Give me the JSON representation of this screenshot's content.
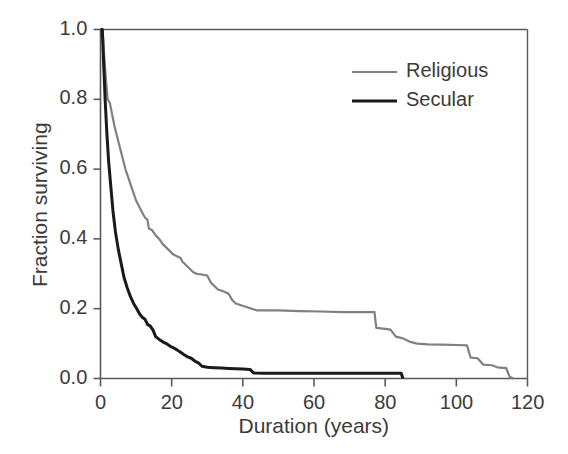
{
  "chart_data": {
    "type": "line",
    "title": "",
    "xlabel": "Duration (years)",
    "ylabel": "Fraction surviving",
    "xlim": [
      0,
      120
    ],
    "ylim": [
      0.0,
      1.0
    ],
    "xticks": [
      0,
      20,
      40,
      60,
      80,
      100,
      120
    ],
    "xtick_labels": [
      "0",
      "20",
      "40",
      "60",
      "80",
      "100",
      "120"
    ],
    "yticks": [
      0.0,
      0.2,
      0.4,
      0.6,
      0.8,
      1.0
    ],
    "ytick_labels": [
      "0.0",
      "0.2",
      "0.4",
      "0.6",
      "0.8",
      "1.0"
    ],
    "grid": false,
    "legend_position": "top-right",
    "series": [
      {
        "name": "Religious",
        "color": "#808080",
        "linewidth": 2.2,
        "points": [
          [
            0,
            1.0
          ],
          [
            0.6,
            1.0
          ],
          [
            1.0,
            0.93
          ],
          [
            1.5,
            0.86
          ],
          [
            2.0,
            0.8
          ],
          [
            2.6,
            0.79
          ],
          [
            3.2,
            0.76
          ],
          [
            4.0,
            0.72
          ],
          [
            5.0,
            0.68
          ],
          [
            6.0,
            0.64
          ],
          [
            7.0,
            0.6
          ],
          [
            8.0,
            0.57
          ],
          [
            9.0,
            0.54
          ],
          [
            10.0,
            0.51
          ],
          [
            11.0,
            0.49
          ],
          [
            12.0,
            0.47
          ],
          [
            12.6,
            0.46
          ],
          [
            13.2,
            0.455
          ],
          [
            13.6,
            0.43
          ],
          [
            14.5,
            0.425
          ],
          [
            15.5,
            0.41
          ],
          [
            16.5,
            0.4
          ],
          [
            17.5,
            0.385
          ],
          [
            18.5,
            0.375
          ],
          [
            19.5,
            0.365
          ],
          [
            20.5,
            0.355
          ],
          [
            21.5,
            0.35
          ],
          [
            22.5,
            0.345
          ],
          [
            23.0,
            0.335
          ],
          [
            24.0,
            0.325
          ],
          [
            25.0,
            0.315
          ],
          [
            26.0,
            0.305
          ],
          [
            27.0,
            0.3
          ],
          [
            28.5,
            0.298
          ],
          [
            30.0,
            0.295
          ],
          [
            31.0,
            0.275
          ],
          [
            32.0,
            0.265
          ],
          [
            33.0,
            0.255
          ],
          [
            34.5,
            0.25
          ],
          [
            36.0,
            0.243
          ],
          [
            37.0,
            0.225
          ],
          [
            38.0,
            0.215
          ],
          [
            39.5,
            0.21
          ],
          [
            41.0,
            0.205
          ],
          [
            42.5,
            0.2
          ],
          [
            44.0,
            0.195
          ],
          [
            50.0,
            0.195
          ],
          [
            56.0,
            0.193
          ],
          [
            62.0,
            0.192
          ],
          [
            68.0,
            0.19
          ],
          [
            74.0,
            0.19
          ],
          [
            77.0,
            0.19
          ],
          [
            77.5,
            0.145
          ],
          [
            80.0,
            0.142
          ],
          [
            81.5,
            0.14
          ],
          [
            83.0,
            0.12
          ],
          [
            85.0,
            0.115
          ],
          [
            87.0,
            0.105
          ],
          [
            89.0,
            0.1
          ],
          [
            92.0,
            0.098
          ],
          [
            96.0,
            0.097
          ],
          [
            100.0,
            0.096
          ],
          [
            103.0,
            0.095
          ],
          [
            104.0,
            0.06
          ],
          [
            106.0,
            0.058
          ],
          [
            107.5,
            0.04
          ],
          [
            110.0,
            0.038
          ],
          [
            111.5,
            0.032
          ],
          [
            114.0,
            0.03
          ],
          [
            115.0,
            0.005
          ],
          [
            116.0,
            0.0
          ]
        ]
      },
      {
        "name": "Secular",
        "color": "#1a1a1a",
        "linewidth": 3.0,
        "points": [
          [
            0,
            1.0
          ],
          [
            0.5,
            1.0
          ],
          [
            0.9,
            0.9
          ],
          [
            1.3,
            0.8
          ],
          [
            1.8,
            0.7
          ],
          [
            2.3,
            0.62
          ],
          [
            2.9,
            0.55
          ],
          [
            3.5,
            0.48
          ],
          [
            4.2,
            0.42
          ],
          [
            5.0,
            0.37
          ],
          [
            5.8,
            0.33
          ],
          [
            6.6,
            0.29
          ],
          [
            7.5,
            0.26
          ],
          [
            8.4,
            0.235
          ],
          [
            9.3,
            0.215
          ],
          [
            10.2,
            0.2
          ],
          [
            11.0,
            0.185
          ],
          [
            11.8,
            0.175
          ],
          [
            12.5,
            0.17
          ],
          [
            13.2,
            0.155
          ],
          [
            14.0,
            0.15
          ],
          [
            14.8,
            0.138
          ],
          [
            15.5,
            0.12
          ],
          [
            16.5,
            0.112
          ],
          [
            17.5,
            0.105
          ],
          [
            18.5,
            0.1
          ],
          [
            19.5,
            0.093
          ],
          [
            20.5,
            0.088
          ],
          [
            21.5,
            0.082
          ],
          [
            22.5,
            0.075
          ],
          [
            23.5,
            0.068
          ],
          [
            24.5,
            0.062
          ],
          [
            25.5,
            0.058
          ],
          [
            26.5,
            0.05
          ],
          [
            27.5,
            0.045
          ],
          [
            28.5,
            0.035
          ],
          [
            30.0,
            0.032
          ],
          [
            32.0,
            0.031
          ],
          [
            34.0,
            0.03
          ],
          [
            36.0,
            0.029
          ],
          [
            38.0,
            0.028
          ],
          [
            40.0,
            0.027
          ],
          [
            42.0,
            0.026
          ],
          [
            43.0,
            0.016
          ],
          [
            46.0,
            0.015
          ],
          [
            52.0,
            0.015
          ],
          [
            58.0,
            0.015
          ],
          [
            64.0,
            0.015
          ],
          [
            70.0,
            0.015
          ],
          [
            76.0,
            0.015
          ],
          [
            82.0,
            0.015
          ],
          [
            84.5,
            0.015
          ],
          [
            85.0,
            0.0
          ]
        ]
      }
    ]
  },
  "legend": {
    "items": [
      {
        "label": "Religious",
        "color": "#808080",
        "linewidth": 2.2
      },
      {
        "label": "Secular",
        "color": "#1a1a1a",
        "linewidth": 3.0
      }
    ]
  },
  "axes": {
    "frame_color": "#5a5a5a",
    "tick_color": "#5a5a5a"
  }
}
